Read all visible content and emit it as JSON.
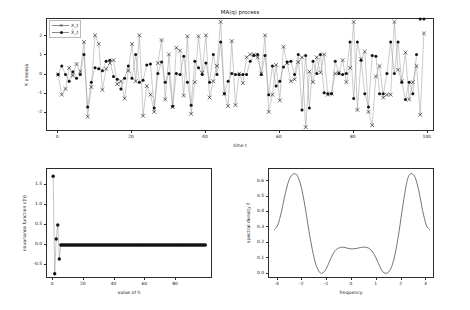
{
  "figure": {
    "width": 470,
    "height": 310,
    "background": "#ffffff",
    "line_color": "#8a8a8a",
    "marker_color": "#111111",
    "axis_color": "#2b2b2b"
  },
  "chart_data": [
    {
      "id": "ma-process",
      "type": "line",
      "title": "MA(q) process",
      "xlabel": "time t",
      "ylabel": "X process",
      "xlim": [
        -3,
        102
      ],
      "ylim": [
        -3.0,
        2.9
      ],
      "xticks": [
        0,
        20,
        40,
        60,
        80,
        100
      ],
      "yticks": [
        -2,
        -1,
        0,
        1,
        2
      ],
      "grid": false,
      "legend_position": "upper left",
      "legend": [
        "X_t",
        "X̂_t"
      ],
      "series": [
        {
          "name": "X_t",
          "marker": "x",
          "x": [
            0,
            1,
            2,
            3,
            4,
            5,
            6,
            7,
            8,
            9,
            10,
            11,
            12,
            13,
            14,
            15,
            16,
            17,
            18,
            19,
            20,
            21,
            22,
            23,
            24,
            25,
            26,
            27,
            28,
            29,
            30,
            31,
            32,
            33,
            34,
            35,
            36,
            37,
            38,
            39,
            40,
            41,
            42,
            43,
            44,
            45,
            46,
            47,
            48,
            49,
            50,
            51,
            52,
            53,
            54,
            55,
            56,
            57,
            58,
            59,
            60,
            61,
            62,
            63,
            64,
            65,
            66,
            67,
            68,
            69,
            70,
            71,
            72,
            73,
            74,
            75,
            76,
            77,
            78,
            79,
            80,
            81,
            82,
            83,
            84,
            85,
            86,
            87,
            88,
            89,
            90,
            91,
            92,
            93,
            94,
            95,
            96,
            97,
            98,
            99
          ],
          "values": [
            0.0,
            -1.05,
            -0.75,
            0.35,
            -0.05,
            0.55,
            0.15,
            1.7,
            -2.2,
            -0.65,
            2.05,
            1.6,
            -0.8,
            0.3,
            0.6,
            0.75,
            -0.5,
            -0.35,
            -1.25,
            0.2,
            1.6,
            -0.35,
            2.05,
            -2.15,
            -0.6,
            -1.05,
            -1.95,
            0.6,
            1.8,
            -1.3,
            1.05,
            -1.7,
            1.4,
            1.25,
            -1.1,
            2.0,
            -2.05,
            -0.4,
            2.0,
            0.1,
            2.05,
            -1.2,
            -0.35,
            0.45,
            2.75,
            -1.0,
            -1.65,
            1.75,
            -1.6,
            0.05,
            -0.45,
            0.9,
            1.05,
            1.05,
            0.9,
            0.05,
            2.05,
            -1.95,
            -1.05,
            0.5,
            -1.35,
            1.45,
            0.6,
            -0.35,
            -0.25,
            0.65,
            0.9,
            -2.75,
            0.15,
            -0.4,
            0.9,
            0.1,
            1.05,
            -1.05,
            -1.0,
            0.05,
            0.1,
            0.75,
            -0.4,
            0.35,
            2.75,
            -1.85,
            0.8,
            1.2,
            -1.95,
            -2.65,
            -0.1,
            0.45,
            -1.2,
            -1.05,
            -1.05,
            2.75,
            0.25,
            -0.35,
            1.15,
            -1.3,
            -0.4,
            0.45,
            -2.1,
            2.15
          ]
        },
        {
          "name": "X̂_t",
          "marker": "o",
          "x": [
            0,
            1,
            2,
            3,
            4,
            5,
            6,
            7,
            8,
            9,
            10,
            11,
            12,
            13,
            14,
            15,
            16,
            17,
            18,
            19,
            20,
            21,
            22,
            23,
            24,
            25,
            26,
            27,
            28,
            29,
            30,
            31,
            32,
            33,
            34,
            35,
            36,
            37,
            38,
            39,
            40,
            41,
            42,
            43,
            44,
            45,
            46,
            47,
            48,
            49,
            50,
            51,
            52,
            53,
            54,
            55,
            56,
            57,
            58,
            59,
            60,
            61,
            62,
            63,
            64,
            65,
            66,
            67,
            68,
            69,
            70,
            71,
            72,
            73,
            74,
            75,
            76,
            77,
            78,
            79,
            80,
            81,
            82,
            83,
            84,
            85,
            86,
            87,
            88,
            89,
            90,
            91,
            92,
            93,
            94,
            95,
            96,
            97,
            98,
            99
          ],
          "values": [
            0.0,
            0.45,
            0.0,
            -0.35,
            0.15,
            -0.2,
            0.0,
            1.05,
            -1.7,
            -0.4,
            0.35,
            0.3,
            0.2,
            0.7,
            0.75,
            -0.1,
            -0.25,
            -0.75,
            -0.2,
            0.45,
            -0.2,
            1.05,
            -0.4,
            -0.3,
            0.5,
            0.55,
            -1.75,
            0.05,
            0.65,
            -0.4,
            0.05,
            -1.65,
            0.05,
            0.0,
            0.95,
            -0.4,
            -1.6,
            0.7,
            0.35,
            0.0,
            0.6,
            -0.4,
            1.05,
            0.0,
            1.7,
            -1.0,
            -0.35,
            0.05,
            0.0,
            0.0,
            0.0,
            0.0,
            0.7,
            1.0,
            1.05,
            0.0,
            1.0,
            -1.05,
            0.45,
            -0.6,
            -0.35,
            0.4,
            0.65,
            0.7,
            0.0,
            1.05,
            -1.85,
            1.0,
            -1.75,
            0.7,
            0.05,
            1.05,
            -0.95,
            -1.0,
            -1.0,
            0.7,
            0.05,
            0.0,
            0.05,
            1.7,
            -1.25,
            1.7,
            0.75,
            -1.0,
            -1.7,
            1.0,
            0.95,
            -1.0,
            -1.0,
            0.05,
            1.7,
            0.05,
            1.7,
            -0.4,
            -1.3,
            -0.4,
            -1.0,
            1.05
          ]
        }
      ]
    },
    {
      "id": "covariance-function",
      "type": "line",
      "title": "",
      "xlabel": "value of h",
      "ylabel": "covariance function c(h)",
      "xlim": [
        -4,
        104
      ],
      "ylim": [
        -0.85,
        1.9
      ],
      "xticks": [
        0,
        20,
        40,
        60,
        80
      ],
      "yticks": [
        -0.5,
        0.0,
        0.5,
        1.0,
        1.5
      ],
      "ytick_labels": [
        "-0.5",
        "0.0",
        "0.5",
        "1.0",
        "1.5"
      ],
      "grid": false,
      "marker": "o",
      "x": [
        0,
        1,
        2,
        3,
        4,
        5,
        6,
        7,
        8,
        9,
        10,
        11,
        12,
        13,
        14,
        15,
        16,
        17,
        18,
        19,
        20,
        21,
        22,
        23,
        24,
        25,
        26,
        27,
        28,
        29,
        30,
        31,
        32,
        33,
        34,
        35,
        36,
        37,
        38,
        39,
        40,
        41,
        42,
        43,
        44,
        45,
        46,
        47,
        48,
        49,
        50,
        51,
        52,
        53,
        54,
        55,
        56,
        57,
        58,
        59,
        60,
        61,
        62,
        63,
        64,
        65,
        66,
        67,
        68,
        69,
        70,
        71,
        72,
        73,
        74,
        75,
        76,
        77,
        78,
        79,
        80,
        81,
        82,
        83,
        84,
        85,
        86,
        87,
        88,
        89,
        90,
        91,
        92,
        93,
        94,
        95,
        96,
        97,
        98,
        99
      ],
      "values": [
        1.72,
        -0.72,
        0.15,
        0.5,
        -0.35,
        0,
        0,
        0,
        0,
        0,
        0,
        0,
        0,
        0,
        0,
        0,
        0,
        0,
        0,
        0,
        0,
        0,
        0,
        0,
        0,
        0,
        0,
        0,
        0,
        0,
        0,
        0,
        0,
        0,
        0,
        0,
        0,
        0,
        0,
        0,
        0,
        0,
        0,
        0,
        0,
        0,
        0,
        0,
        0,
        0,
        0,
        0,
        0,
        0,
        0,
        0,
        0,
        0,
        0,
        0,
        0,
        0,
        0,
        0,
        0,
        0,
        0,
        0,
        0,
        0,
        0,
        0,
        0,
        0,
        0,
        0,
        0,
        0,
        0,
        0,
        0,
        0,
        0,
        0,
        0,
        0,
        0,
        0,
        0,
        0,
        0,
        0,
        0,
        0,
        0,
        0,
        0,
        0,
        0,
        0
      ]
    },
    {
      "id": "spectral-density",
      "type": "line",
      "title": "",
      "xlabel": "frequency",
      "ylabel": "spectral density f",
      "xlim": [
        -3.35,
        3.35
      ],
      "ylim": [
        -0.035,
        0.68
      ],
      "xticks": [
        -3,
        -2,
        -1,
        0,
        1,
        2,
        3
      ],
      "yticks": [
        0.0,
        0.1,
        0.2,
        0.3,
        0.4,
        0.5,
        0.6
      ],
      "ytick_labels": [
        "0.0",
        "0.1",
        "0.2",
        "0.3",
        "0.4",
        "0.5",
        "0.6"
      ],
      "grid": false,
      "x": [
        -3.1416,
        -3.0,
        -2.85,
        -2.7,
        -2.55,
        -2.4,
        -2.3,
        -2.2,
        -2.05,
        -1.9,
        -1.75,
        -1.6,
        -1.45,
        -1.3,
        -1.2,
        -1.1,
        -1.0,
        -0.85,
        -0.7,
        -0.55,
        -0.4,
        -0.25,
        -0.1,
        0.05,
        0.2,
        0.35,
        0.5,
        0.65,
        0.8,
        0.95,
        1.1,
        1.2,
        1.3,
        1.45,
        1.6,
        1.75,
        1.9,
        2.05,
        2.2,
        2.3,
        2.4,
        2.55,
        2.7,
        2.85,
        3.0,
        3.1416
      ],
      "values": [
        0.285,
        0.315,
        0.4,
        0.515,
        0.605,
        0.645,
        0.648,
        0.635,
        0.565,
        0.44,
        0.29,
        0.155,
        0.055,
        0.008,
        0.003,
        0.016,
        0.045,
        0.1,
        0.145,
        0.165,
        0.172,
        0.168,
        0.162,
        0.161,
        0.164,
        0.17,
        0.172,
        0.167,
        0.148,
        0.108,
        0.055,
        0.022,
        0.005,
        0.006,
        0.045,
        0.135,
        0.275,
        0.44,
        0.585,
        0.638,
        0.65,
        0.625,
        0.535,
        0.41,
        0.315,
        0.285
      ]
    }
  ]
}
